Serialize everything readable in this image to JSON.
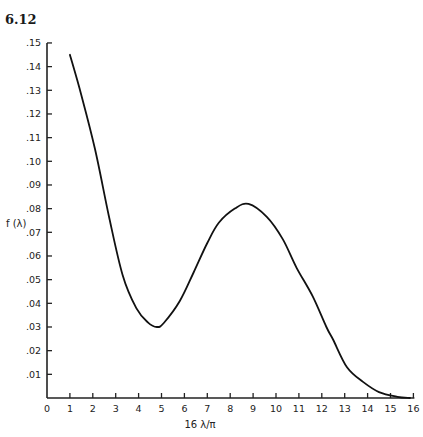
{
  "figure": {
    "number": "6.12"
  },
  "chart_data": {
    "type": "line",
    "title": "",
    "xlabel": "16 λ/π",
    "ylabel": "f (λ)",
    "xlim": [
      0,
      16
    ],
    "ylim": [
      0,
      0.15
    ],
    "grid": false,
    "legend": null,
    "x_ticks": [
      "0",
      "1",
      "2",
      "3",
      "4",
      "5",
      "6",
      "7",
      "8",
      "9",
      "10",
      "11",
      "12",
      "13",
      "14",
      "15",
      "16"
    ],
    "y_ticks": [
      ".01",
      ".02",
      ".03",
      ".04",
      ".05",
      ".06",
      ".07",
      ".08",
      ".09",
      ".10",
      ".11",
      ".12",
      ".13",
      ".14",
      ".15"
    ],
    "series": [
      {
        "name": "f(λ)",
        "x": [
          1.0,
          1.5,
          2.1,
          2.7,
          3.3,
          3.9,
          4.4,
          4.8,
          5.1,
          5.8,
          6.4,
          7.0,
          7.5,
          8.2,
          8.8,
          9.6,
          10.3,
          10.9,
          11.6,
          12.2,
          12.5,
          13.1,
          13.8,
          14.5,
          15.3,
          15.85
        ],
        "y": [
          0.145,
          0.128,
          0.105,
          0.077,
          0.052,
          0.038,
          0.032,
          0.03,
          0.0317,
          0.041,
          0.053,
          0.0655,
          0.074,
          0.08,
          0.082,
          0.0765,
          0.067,
          0.055,
          0.043,
          0.03,
          0.0245,
          0.013,
          0.0068,
          0.0025,
          0.0005,
          0.0
        ]
      }
    ],
    "annotations": {
      "maximum": {
        "x": 8.8,
        "y": 0.082
      },
      "minimum": {
        "x": 4.8,
        "y": 0.03
      }
    }
  }
}
